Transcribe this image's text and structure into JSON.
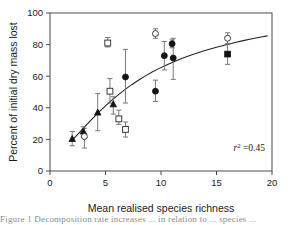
{
  "figure": {
    "caption_partial": "Figure 1 Decomposition rate increases ... in relation to ... species ..."
  },
  "chart_data": {
    "type": "scatter",
    "title": "",
    "xlabel": "Mean realised species richness",
    "ylabel": "Percent of initial dry mass lost",
    "xlim": [
      0,
      20
    ],
    "ylim": [
      0,
      100
    ],
    "xticks": [
      0,
      5,
      10,
      15,
      20
    ],
    "yticks": [
      0,
      20,
      40,
      60,
      80,
      100
    ],
    "grid": false,
    "legend": "none",
    "annotations": [
      {
        "text_prefix": "r",
        "text_sup": "2",
        "text_suffix": "=0.45",
        "full": "r2=0.45",
        "x": 16.2,
        "y": 13
      }
    ],
    "fit_curve": {
      "label": "fitted saturating curve",
      "x": [
        2.0,
        2.6,
        3.2,
        3.8,
        4.4,
        5.0,
        5.6,
        6.2,
        6.8,
        7.4,
        8.0,
        8.6,
        9.2,
        9.8,
        10.4,
        11.0,
        11.8,
        12.6,
        13.4,
        14.2,
        15.0,
        15.8,
        16.6,
        17.4,
        18.2,
        19.0,
        19.6
      ],
      "y": [
        19.5,
        24.0,
        28.5,
        33.0,
        37.2,
        41.2,
        45.0,
        48.5,
        51.8,
        54.8,
        57.6,
        60.2,
        62.6,
        64.8,
        66.8,
        68.7,
        71.0,
        73.1,
        75.0,
        76.7,
        78.3,
        79.8,
        81.2,
        82.5,
        83.7,
        84.8,
        85.5
      ]
    },
    "series": [
      {
        "name": "filled-triangle",
        "marker": "triangle-filled",
        "points": [
          {
            "x": 2.0,
            "y": 20.3,
            "err_low": 16.0,
            "err_high": 25.0
          },
          {
            "x": 3.0,
            "y": 25.0,
            "err_low": 21.5,
            "err_high": 28.0
          },
          {
            "x": 4.3,
            "y": 37.0,
            "err_low": 25.5,
            "err_high": 49.0
          },
          {
            "x": 5.7,
            "y": 42.2,
            "err_low": 36.0,
            "err_high": 47.0
          }
        ]
      },
      {
        "name": "open-square",
        "marker": "square-open",
        "points": [
          {
            "x": 5.2,
            "y": 81.0,
            "err_low": 78.5,
            "err_high": 84.5
          },
          {
            "x": 5.4,
            "y": 50.5,
            "err_low": 43.0,
            "err_high": 58.5
          },
          {
            "x": 6.2,
            "y": 33.0,
            "err_low": 29.5,
            "err_high": 38.5
          },
          {
            "x": 6.8,
            "y": 26.3,
            "err_low": 21.5,
            "err_high": 31.0
          }
        ]
      },
      {
        "name": "filled-circle",
        "marker": "circle-filled",
        "points": [
          {
            "x": 6.8,
            "y": 59.5,
            "err_low": 43.0,
            "err_high": 77.0
          },
          {
            "x": 9.5,
            "y": 50.5,
            "err_low": 44.0,
            "err_high": 57.5
          },
          {
            "x": 10.3,
            "y": 73.0,
            "err_low": 64.0,
            "err_high": 82.0
          },
          {
            "x": 11.0,
            "y": 80.5,
            "err_low": 78.0,
            "err_high": 83.0
          },
          {
            "x": 11.1,
            "y": 71.5,
            "err_low": 58.0,
            "err_high": 84.0
          }
        ]
      },
      {
        "name": "open-circle",
        "marker": "circle-open",
        "points": [
          {
            "x": 3.1,
            "y": 21.8,
            "err_low": 14.5,
            "err_high": 27.0
          },
          {
            "x": 9.5,
            "y": 87.0,
            "err_low": 84.0,
            "err_high": 90.0
          },
          {
            "x": 16.0,
            "y": 84.0,
            "err_low": 80.5,
            "err_high": 87.5
          }
        ]
      },
      {
        "name": "filled-square",
        "marker": "square-filled",
        "points": [
          {
            "x": 16.0,
            "y": 74.0,
            "err_low": 67.5,
            "err_high": 80.5
          }
        ]
      }
    ]
  }
}
